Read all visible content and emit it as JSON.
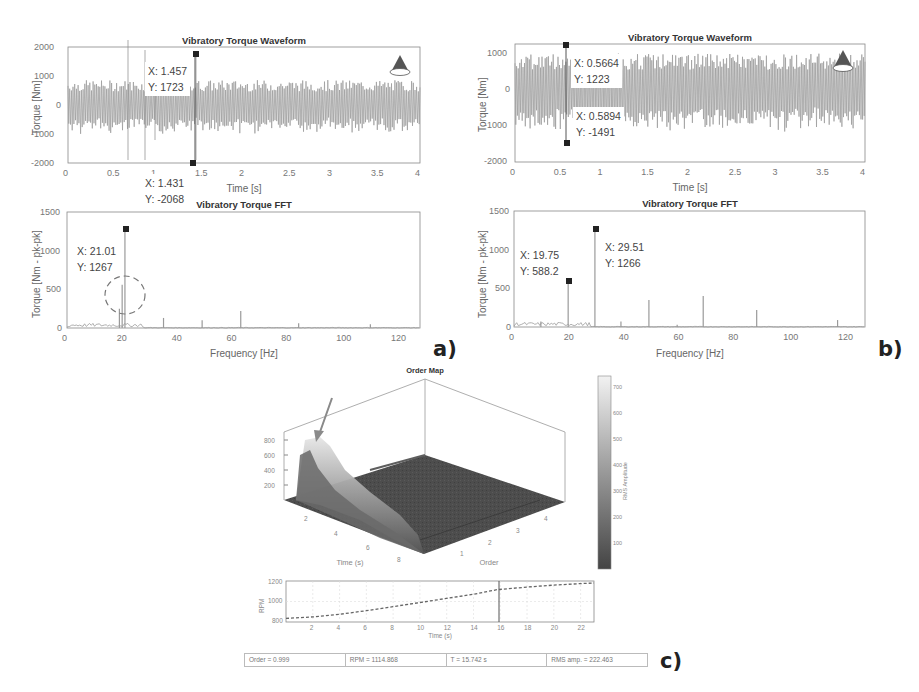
{
  "chart_data": [
    {
      "id": "a_waveform",
      "type": "line",
      "title": "Vibratory Torque Waveform",
      "xlabel": "Time [s]",
      "ylabel": "Torque [Nm]",
      "xlim": [
        0,
        4
      ],
      "ylim": [
        -2000,
        2000
      ],
      "xticks": [
        "0",
        "0.5",
        "1",
        "1.5",
        "2",
        "2.5",
        "3",
        "3.5",
        "4"
      ],
      "yticks": [
        "2000",
        "1000",
        "0",
        "-1000",
        "-2000"
      ],
      "grid": false,
      "datatips": [
        {
          "x_label": "X: 1.457",
          "y_label": "Y: 1723",
          "x": 1.457,
          "y": 1723
        },
        {
          "x_label": "X: 1.431",
          "y_label": "Y: -2068",
          "x": 1.431,
          "y": -2068
        }
      ],
      "logo": "ALS"
    },
    {
      "id": "a_fft",
      "type": "line",
      "title": "Vibratory Torque FFT",
      "xlabel": "Frequency [Hz]",
      "ylabel": "Torque [Nm - pk-pk]",
      "xlim": [
        0,
        128
      ],
      "ylim": [
        0,
        1500
      ],
      "xticks": [
        "0",
        "20",
        "40",
        "60",
        "80",
        "100",
        "120"
      ],
      "yticks": [
        "1500",
        "1000",
        "500",
        "0"
      ],
      "grid": false,
      "peaks": [
        {
          "x": 21.01,
          "y": 1267
        },
        {
          "x": 20.0,
          "y": 560
        },
        {
          "x": 19.0,
          "y": 250
        },
        {
          "x": 35.0,
          "y": 130
        },
        {
          "x": 49.0,
          "y": 100
        },
        {
          "x": 63.0,
          "y": 220
        },
        {
          "x": 84.0,
          "y": 60
        },
        {
          "x": 110.0,
          "y": 50
        }
      ],
      "datatips": [
        {
          "x_label": "X: 21.01",
          "y_label": "Y: 1267",
          "x": 21.01,
          "y": 1267
        }
      ],
      "annotation": "dashed circle around 20 Hz sideband peaks"
    },
    {
      "id": "b_waveform",
      "type": "line",
      "title": "Vibratory Torque Waveform",
      "xlabel": "Time [s]",
      "ylabel": "Torque [Nm]",
      "xlim": [
        0,
        4
      ],
      "ylim": [
        -2000,
        1250
      ],
      "xticks": [
        "0",
        "0.5",
        "1",
        "1.5",
        "2",
        "2.5",
        "3",
        "3.5",
        "4"
      ],
      "yticks": [
        "1000",
        "0",
        "-1000",
        "-2000"
      ],
      "grid": false,
      "datatips": [
        {
          "x_label": "X: 0.5664",
          "y_label": "Y: 1223",
          "x": 0.5664,
          "y": 1223
        },
        {
          "x_label": "X: 0.5894",
          "y_label": "Y: -1491",
          "x": 0.5894,
          "y": -1491
        }
      ],
      "logo": "ALS"
    },
    {
      "id": "b_fft",
      "type": "line",
      "title": "Vibratory Torque FFT",
      "xlabel": "Frequency [Hz]",
      "ylabel": "Torque [Nm - pk-pk]",
      "xlim": [
        0,
        128
      ],
      "ylim": [
        0,
        1500
      ],
      "xticks": [
        "0",
        "20",
        "40",
        "60",
        "80",
        "100",
        "120"
      ],
      "yticks": [
        "1500",
        "1000",
        "500",
        "0"
      ],
      "grid": false,
      "peaks": [
        {
          "x": 9.8,
          "y": 70
        },
        {
          "x": 19.75,
          "y": 588.2
        },
        {
          "x": 29.51,
          "y": 1266
        },
        {
          "x": 39.0,
          "y": 70
        },
        {
          "x": 49.2,
          "y": 350
        },
        {
          "x": 59.5,
          "y": 30
        },
        {
          "x": 69.0,
          "y": 400
        },
        {
          "x": 88.5,
          "y": 220
        },
        {
          "x": 118.0,
          "y": 90
        }
      ],
      "datatips": [
        {
          "x_label": "X: 19.75",
          "y_label": "Y: 588.2",
          "x": 19.75,
          "y": 588.2
        },
        {
          "x_label": "X: 29.51",
          "y_label": "Y: 1266",
          "x": 29.51,
          "y": 1266
        }
      ]
    },
    {
      "id": "c_order_map",
      "type": "surface",
      "title": "Order Map",
      "xlabel": "Time (s)",
      "ylabel": "Order",
      "zlabel": "",
      "xticks": [
        "2",
        "4",
        "6",
        "8"
      ],
      "yticks": [
        "1",
        "2",
        "3",
        "4"
      ],
      "zticks": [
        "800",
        "600",
        "400",
        "200"
      ],
      "colorbar": {
        "label": "RMS Amplitude",
        "ticks": [
          "700",
          "600",
          "500",
          "400",
          "300",
          "200",
          "100"
        ],
        "range": [
          0,
          750
        ]
      },
      "annotation": "arrow pointing to peak amplitude (~780) at order ~1, time ~1 s"
    },
    {
      "id": "c_rpm",
      "type": "line",
      "xlabel": "Time (s)",
      "ylabel": "RPM",
      "xlim": [
        0,
        23
      ],
      "ylim": [
        800,
        1200
      ],
      "xticks": [
        "2",
        "4",
        "6",
        "8",
        "10",
        "12",
        "14",
        "16",
        "18",
        "20",
        "22"
      ],
      "yticks": [
        "1200",
        "1000",
        "800"
      ],
      "grid": true,
      "x": [
        0,
        2,
        4,
        6,
        8,
        10,
        12,
        14,
        15.742,
        18,
        20,
        22,
        23
      ],
      "values": [
        835,
        850,
        875,
        910,
        950,
        990,
        1030,
        1070,
        1114.868,
        1140,
        1160,
        1175,
        1180
      ],
      "cursor_x": 15.742
    }
  ],
  "panels": {
    "a": {
      "label": "a)",
      "waveform": {
        "title": "Vibratory Torque Waveform",
        "xlabel": "Time [s]",
        "ylabel": "Torque [Nm]",
        "yticks": [
          "2000",
          "1000",
          "0",
          "-1000",
          "-2000"
        ],
        "xticks": [
          "0",
          "0.5",
          "1",
          "1.5",
          "2",
          "2.5",
          "3",
          "3.5",
          "4"
        ],
        "tip1_x": "X: 1.457",
        "tip1_y": "Y: 1723",
        "tip2_x": "X: 1.431",
        "tip2_y": "Y: -2068",
        "logo": "ALS"
      },
      "fft": {
        "title": "Vibratory Torque FFT",
        "xlabel": "Frequency [Hz]",
        "ylabel": "Torque [Nm - pk-pk]",
        "yticks": [
          "1500",
          "1000",
          "500",
          "0"
        ],
        "xticks": [
          "0",
          "20",
          "40",
          "60",
          "80",
          "100",
          "120"
        ],
        "tip1_x": "X: 21.01",
        "tip1_y": "Y: 1267"
      }
    },
    "b": {
      "label": "b)",
      "waveform": {
        "title": "Vibratory Torque Waveform",
        "xlabel": "Time [s]",
        "ylabel": "Torque [Nm]",
        "yticks": [
          "1000",
          "0",
          "-1000",
          "-2000"
        ],
        "xticks": [
          "0",
          "0.5",
          "1",
          "1.5",
          "2",
          "2.5",
          "3",
          "3.5",
          "4"
        ],
        "tip1_x": "X: 0.5664",
        "tip1_y": "Y: 1223",
        "tip2_x": "X: 0.5894",
        "tip2_y": "Y: -1491",
        "logo": "ALS"
      },
      "fft": {
        "title": "Vibratory Torque FFT",
        "xlabel": "Frequency [Hz]",
        "ylabel": "Torque [Nm - pk-pk]",
        "yticks": [
          "1500",
          "1000",
          "500",
          "0"
        ],
        "xticks": [
          "0",
          "20",
          "40",
          "60",
          "80",
          "100",
          "120"
        ],
        "tip1_x": "X: 19.75",
        "tip1_y": "Y: 588.2",
        "tip2_x": "X: 29.51",
        "tip2_y": "Y: 1266"
      }
    },
    "c": {
      "label": "c)",
      "order_map": {
        "title": "Order Map",
        "time_label": "Time (s)",
        "order_label": "Order",
        "zticks": [
          "800",
          "600",
          "400",
          "200"
        ],
        "time_ticks": [
          "2",
          "4",
          "6",
          "8"
        ],
        "order_ticks": [
          "1",
          "2",
          "3",
          "4"
        ],
        "colorbar_label": "RMS Amplitude",
        "colorbar_ticks": [
          "700",
          "600",
          "500",
          "400",
          "300",
          "200",
          "100"
        ]
      },
      "rpm": {
        "ylabel": "RPM",
        "xlabel": "Time (s)",
        "yticks": [
          "1200",
          "1000",
          "800"
        ],
        "xticks": [
          "2",
          "4",
          "6",
          "8",
          "10",
          "12",
          "14",
          "16",
          "18",
          "20",
          "22"
        ]
      },
      "status": {
        "order": "Order = 0.999",
        "rpm": "RPM = 1114.868",
        "t": "T = 15.742 s",
        "rms": "RMS amp. = 222.463"
      }
    }
  },
  "colors": {
    "trace": "#9a9a9a",
    "marker": "#222222",
    "axis": "#888888",
    "arrow": "#8a8a8a",
    "surface_dark": "#4a4a4a",
    "surface_light": "#e8e8e8"
  }
}
